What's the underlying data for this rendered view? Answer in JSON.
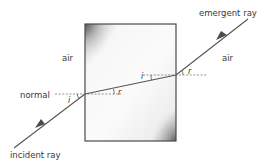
{
  "diagram": {
    "labels": {
      "incident_ray": "incident ray",
      "emergent_ray": "emergent ray",
      "normal": "normal",
      "air_left": "air",
      "air_right": "air"
    },
    "angles": {
      "entry_incidence": "i",
      "entry_refraction": "r",
      "exit_incidence": "i",
      "exit_refraction": "r"
    },
    "block": {
      "x": 85,
      "y": 24,
      "width": 91,
      "height": 117,
      "border_color": "#4a4a4a",
      "fill_color": "#f4f4f4"
    },
    "rays": {
      "incident": {
        "from": [
          14,
          148
        ],
        "to": [
          85,
          94
        ]
      },
      "refracted": {
        "from": [
          85,
          94
        ],
        "to": [
          176,
          75
        ]
      },
      "emergent": {
        "from": [
          176,
          75
        ],
        "to": [
          248,
          19
        ]
      }
    },
    "normals": {
      "entry": {
        "from": [
          55,
          94
        ],
        "to": [
          121,
          94
        ]
      },
      "exit": {
        "from": [
          143,
          75
        ],
        "to": [
          207,
          75
        ]
      }
    },
    "colors": {
      "ray": "#555555",
      "normal": "#777777",
      "text": "#3a3a3a"
    }
  }
}
